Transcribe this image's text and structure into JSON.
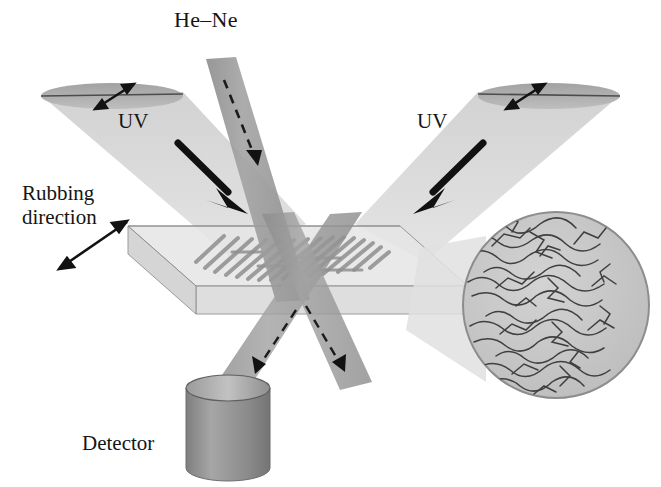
{
  "figure": {
    "background": "#ffffff"
  },
  "labels": {
    "hene": "He–Ne",
    "uv_left": "UV",
    "uv_right": "UV",
    "rubbing": "Rubbing\ndirection",
    "detector": "Detector"
  },
  "colors": {
    "ink": "#151515",
    "probe_beam": "#9b9b9b",
    "probe_beam_dark": "#8a8a8a",
    "uv_cone": "#d7d7d7",
    "uv_cone_cap": "#a8a8a8",
    "substrate_top": "#e3e3e3",
    "substrate_front": "#d2d2d2",
    "substrate_side": "#c6c6c6",
    "substrate_edge": "#8c8c8c",
    "fringe": "#8f8f8f",
    "magnifier_fill": "#c9c9c9",
    "magnifier_edge": "#8d8d8d",
    "magnifier_cone": "#dedede",
    "chain": "#4a4a4a",
    "detector_body": "#8f8f8f",
    "detector_top": "#b4b4b4",
    "detector_edge": "#6d6d6d"
  },
  "elements": {
    "probe_beam_in": {
      "name": "he-ne-incident-beam",
      "arrow": "dashed-down"
    },
    "diffracted_left": {
      "name": "diffracted-beam-left",
      "arrow": "dashed-down"
    },
    "diffracted_right": {
      "name": "diffracted-beam-right",
      "arrow": "dashed-down"
    },
    "uv_beam_left": {
      "name": "uv-beam-left",
      "polarization": "double-headed-arrow"
    },
    "uv_beam_right": {
      "name": "uv-beam-right",
      "polarization": "double-headed-arrow"
    },
    "uv_arrow_left": {
      "name": "uv-direction-arrow-left",
      "direction": "down-right"
    },
    "uv_arrow_right": {
      "name": "uv-direction-arrow-right",
      "direction": "down-left"
    },
    "substrate": {
      "name": "substrate-slab",
      "shape": "parallelepiped"
    },
    "fringes": {
      "name": "interference-fringe-pattern",
      "count": 26,
      "orientation": "diagonal"
    },
    "rubbing_arrow": {
      "name": "rubbing-direction-arrow",
      "type": "double-headed"
    },
    "magnifier": {
      "name": "magnified-polymer-inset",
      "content": "aligned-polymer-chains"
    },
    "detector": {
      "name": "detector-cylinder"
    }
  }
}
